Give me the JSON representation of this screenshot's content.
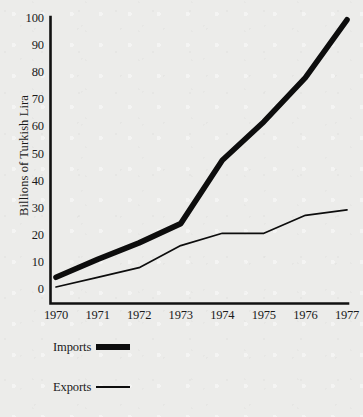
{
  "chart_data": {
    "type": "line",
    "title": "",
    "xlabel": "",
    "ylabel": "Billions of Turkish Lira",
    "x": [
      "1970",
      "1971",
      "1972",
      "1973",
      "1974",
      "1975",
      "1976",
      "1977"
    ],
    "categories": [
      "1970",
      "1971",
      "1972",
      "1973",
      "1974",
      "1975",
      "1976",
      "1977"
    ],
    "xlim": [
      1970,
      1977
    ],
    "ylim": [
      0,
      104
    ],
    "yticks": [
      "0",
      "10",
      "20",
      "30",
      "40",
      "50",
      "60",
      "70",
      "80",
      "90",
      "100"
    ],
    "ytick_values": [
      0,
      10,
      20,
      30,
      40,
      50,
      60,
      70,
      80,
      90,
      100
    ],
    "grid": false,
    "legend_position": "below-plot-left",
    "series": [
      {
        "name": "Imports",
        "values": [
          9.5,
          16,
          22,
          29,
          52,
          66,
          82,
          103
        ],
        "line_style": "thick-solid",
        "color": "#0d0d0d"
      },
      {
        "name": "Exports",
        "values": [
          6,
          9.5,
          13,
          21,
          25.5,
          25.5,
          32,
          34
        ],
        "line_style": "thin-solid",
        "color": "#0d0d0d"
      }
    ],
    "annotations": []
  },
  "legend": {
    "items": [
      {
        "label": "Imports",
        "swatch": "thick-line-swatch"
      },
      {
        "label": "Exports",
        "swatch": "thin-line-swatch"
      }
    ]
  },
  "colors": {
    "background": "#ececea",
    "ink": "#0d0d0d",
    "axis": "#111111"
  }
}
